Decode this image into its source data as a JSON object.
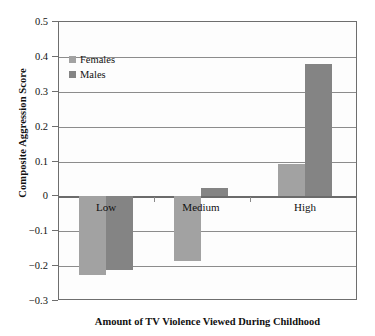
{
  "chart_data": {
    "type": "bar",
    "title": "",
    "categories": [
      "Low",
      "Medium",
      "High"
    ],
    "series": [
      {
        "name": "Females",
        "values": [
          -0.225,
          -0.185,
          0.093
        ],
        "color": "#a2a2a2"
      },
      {
        "name": "Males",
        "values": [
          -0.212,
          0.025,
          0.38
        ],
        "color": "#848484"
      }
    ],
    "xlabel": "Amount of TV Violence Viewed During Childhood",
    "ylabel": "Composite Aggression Score",
    "ylim": [
      -0.3,
      0.5
    ],
    "yticks": [
      "0.5",
      "0.4",
      "0.3",
      "0.2",
      "0.1",
      "0",
      "−0.1",
      "−0.2",
      "−0.3"
    ],
    "ytick_values": [
      0.5,
      0.4,
      0.3,
      0.2,
      0.1,
      0,
      -0.1,
      -0.2,
      -0.3
    ],
    "grid": true,
    "legend_position": "top-left",
    "zero_line": 0
  },
  "axes": {
    "y_title": "Composite Aggression Score",
    "x_title": "Amount of TV Violence Viewed During Childhood"
  },
  "legend": {
    "entries": [
      {
        "label": "Females",
        "swatch": "#a2a2a2"
      },
      {
        "label": "Males",
        "swatch": "#848484"
      }
    ]
  },
  "category_labels": [
    "Low",
    "Medium",
    "High"
  ]
}
